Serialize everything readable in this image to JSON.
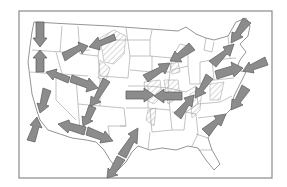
{
  "map": {
    "type": "contiguous-us-state-outline-map",
    "frame_color": "#8a8a8a",
    "arrow_fill": "#8c8c8c",
    "arrow_stroke": "#5a5a5a",
    "hatch_color": "#a0a0a0",
    "arrows": [
      {
        "id": "pacific-nw-down",
        "from": [
          40,
          24
        ],
        "to": [
          40,
          46
        ]
      },
      {
        "id": "oregon-up",
        "from": [
          40,
          72
        ],
        "to": [
          40,
          52
        ]
      },
      {
        "id": "idaho-northeast",
        "from": [
          64,
          57
        ],
        "to": [
          86,
          46
        ]
      },
      {
        "id": "montana-southwest",
        "from": [
          112,
          37
        ],
        "to": [
          91,
          47
        ]
      },
      {
        "id": "nevada-northwest",
        "from": [
          68,
          81
        ],
        "to": [
          48,
          73
        ]
      },
      {
        "id": "utah-east",
        "from": [
          72,
          79
        ],
        "to": [
          96,
          88
        ]
      },
      {
        "id": "colorado-southwest",
        "from": [
          106,
          80
        ],
        "to": [
          92,
          104
        ]
      },
      {
        "id": "arizona-southwest",
        "from": [
          92,
          106
        ],
        "to": [
          84,
          124
        ]
      },
      {
        "id": "california-down",
        "from": [
          47,
          90
        ],
        "to": [
          40,
          111
        ]
      },
      {
        "id": "socal-up",
        "from": [
          31,
          141
        ],
        "to": [
          37,
          119
        ]
      },
      {
        "id": "border-west",
        "from": [
          85,
          131
        ],
        "to": [
          60,
          124
        ]
      },
      {
        "id": "border-east",
        "from": [
          87,
          131
        ],
        "to": [
          111,
          140
        ]
      },
      {
        "id": "texas-northeast",
        "from": [
          122,
          155
        ],
        "to": [
          137,
          130
        ]
      },
      {
        "id": "texas-southwest",
        "from": [
          120,
          158
        ],
        "to": [
          108,
          176
        ]
      },
      {
        "id": "kansas-east",
        "from": [
          126,
          95
        ],
        "to": [
          152,
          95
        ]
      },
      {
        "id": "missouri-west",
        "from": [
          182,
          96
        ],
        "to": [
          156,
          96
        ]
      },
      {
        "id": "iowa-northeast",
        "from": [
          146,
          79
        ],
        "to": [
          168,
          64
        ]
      },
      {
        "id": "wisconsin-southwest",
        "from": [
          192,
          47
        ],
        "to": [
          172,
          60
        ]
      },
      {
        "id": "maine-southwest",
        "from": [
          247,
          21
        ],
        "to": [
          232,
          41
        ]
      },
      {
        "id": "ny-northeast",
        "from": [
          213,
          64
        ],
        "to": [
          233,
          45
        ]
      },
      {
        "id": "atlantic-west",
        "from": [
          267,
          61
        ],
        "to": [
          245,
          70
        ]
      },
      {
        "id": "pennsylvania-east",
        "from": [
          216,
          75
        ],
        "to": [
          241,
          68
        ]
      },
      {
        "id": "ohio-southwest",
        "from": [
          209,
          77
        ],
        "to": [
          196,
          96
        ]
      },
      {
        "id": "kentucky-northeast",
        "from": [
          178,
          116
        ],
        "to": [
          192,
          97
        ]
      },
      {
        "id": "virginia-southwest",
        "from": [
          246,
          88
        ],
        "to": [
          232,
          108
        ]
      },
      {
        "id": "carolina-northeast",
        "from": [
          206,
          133
        ],
        "to": [
          224,
          116
        ]
      }
    ]
  }
}
